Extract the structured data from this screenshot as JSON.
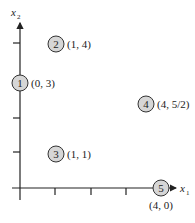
{
  "axes": {
    "x_label": "x",
    "x_sub": "1",
    "y_label": "x",
    "y_sub": "2",
    "x_ticks": [
      1,
      2,
      3
    ],
    "y_ticks": [
      1,
      2,
      4
    ]
  },
  "nodes": [
    {
      "id": "1",
      "coord": "(0, 3)"
    },
    {
      "id": "2",
      "coord": "(1, 4)"
    },
    {
      "id": "3",
      "coord": "(1, 1)"
    },
    {
      "id": "4",
      "coord": "(4, 5/2)"
    },
    {
      "id": "5",
      "coord": "(4, 0)"
    }
  ],
  "colors": {
    "node_fill": "#d6d6d6",
    "stroke": "#222222"
  }
}
